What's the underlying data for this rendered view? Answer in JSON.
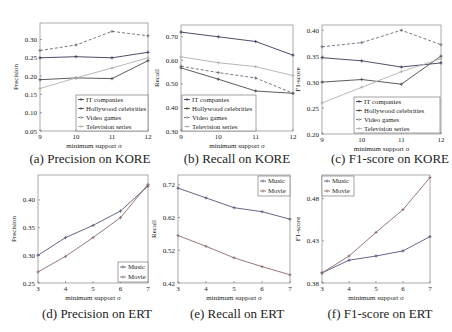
{
  "figure": {
    "captions": [
      "(a) Precision on KORE",
      "(b) Recall on KORE",
      "(c) F1-score on KORE",
      "(d) Precision on ERT",
      "(e) Recall on ERT",
      "(f) F1-score on ERT"
    ]
  },
  "chart_data": [
    {
      "id": "a",
      "type": "line",
      "title": "(a) Precision on KORE",
      "xlabel": "minimum support σ",
      "ylabel": "Precision",
      "x": [
        9,
        10,
        11,
        12
      ],
      "xticks": [
        9,
        10,
        11,
        12
      ],
      "yticks": [
        0.05,
        0.1,
        0.15,
        0.2,
        0.25,
        0.3
      ],
      "ytick_labels": [
        "0.05",
        "0.10",
        "0.15",
        "0.20",
        "0.25",
        "0.30"
      ],
      "ylim": [
        0.05,
        0.345
      ],
      "grid": false,
      "legend_position": "lower right",
      "series": [
        {
          "name": "IT companies",
          "values": [
            0.25,
            0.253,
            0.25,
            0.265
          ],
          "color": "#3a3a5a",
          "dash": ""
        },
        {
          "name": "Hollywood celebrities",
          "values": [
            0.19,
            0.195,
            0.193,
            0.242
          ],
          "color": "#4a4a4a",
          "dash": ""
        },
        {
          "name": "Video games",
          "values": [
            0.27,
            0.285,
            0.322,
            0.31
          ],
          "color": "#6a6a7a",
          "dash": "3,2"
        },
        {
          "name": "Television series",
          "values": [
            0.166,
            0.195,
            0.222,
            0.25
          ],
          "color": "#b0b0b0",
          "dash": ""
        }
      ]
    },
    {
      "id": "b",
      "type": "line",
      "title": "(b) Recall on KORE",
      "xlabel": "minimum support σ",
      "ylabel": "Recall",
      "x": [
        9,
        10,
        11,
        12
      ],
      "xticks": [
        9,
        10,
        11,
        12
      ],
      "yticks": [
        0.3,
        0.4,
        0.5,
        0.6,
        0.7
      ],
      "ytick_labels": [
        "0.30",
        "0.40",
        "0.50",
        "0.60",
        "0.70"
      ],
      "ylim": [
        0.3,
        0.75
      ],
      "grid": false,
      "legend_position": "lower left",
      "series": [
        {
          "name": "IT companies",
          "values": [
            0.72,
            0.7,
            0.68,
            0.622
          ],
          "color": "#3a3a5a",
          "dash": ""
        },
        {
          "name": "Hollywood celebrities",
          "values": [
            0.568,
            0.52,
            0.47,
            0.46
          ],
          "color": "#4a4a4a",
          "dash": ""
        },
        {
          "name": "Video games",
          "values": [
            0.575,
            0.548,
            0.525,
            0.46
          ],
          "color": "#6a6a7a",
          "dash": "3,2"
        },
        {
          "name": "Television series",
          "values": [
            0.615,
            0.59,
            0.573,
            0.535
          ],
          "color": "#b0b0b0",
          "dash": ""
        }
      ]
    },
    {
      "id": "c",
      "type": "line",
      "title": "(c) F1-score on KORE",
      "xlabel": "minimum support σ",
      "ylabel": "F1-score",
      "x": [
        9,
        10,
        11,
        12
      ],
      "xticks": [
        9,
        10,
        11,
        12
      ],
      "yticks": [
        0.2,
        0.25,
        0.3,
        0.35,
        0.4
      ],
      "ytick_labels": [
        "0.20",
        "0.25",
        "0.30",
        "0.35",
        "0.40"
      ],
      "ylim": [
        0.2,
        0.41
      ],
      "grid": false,
      "legend_position": "lower right",
      "series": [
        {
          "name": "IT companies",
          "values": [
            0.347,
            0.341,
            0.329,
            0.337
          ],
          "color": "#3a3a5a",
          "dash": ""
        },
        {
          "name": "Hollywood celebrities",
          "values": [
            0.3,
            0.305,
            0.296,
            0.35
          ],
          "color": "#4a4a4a",
          "dash": ""
        },
        {
          "name": "Video games",
          "values": [
            0.368,
            0.376,
            0.4,
            0.372
          ],
          "color": "#6a6a7a",
          "dash": "3,2"
        },
        {
          "name": "Television series",
          "values": [
            0.26,
            0.29,
            0.32,
            0.345
          ],
          "color": "#b0b0b0",
          "dash": ""
        }
      ]
    },
    {
      "id": "d",
      "type": "line",
      "title": "(d) Precision on ERT",
      "xlabel": "minimum support σ",
      "ylabel": "Precision",
      "x": [
        3,
        4,
        5,
        6,
        7
      ],
      "xticks": [
        3,
        4,
        5,
        6,
        7
      ],
      "yticks": [
        0.25,
        0.3,
        0.35,
        0.4
      ],
      "ytick_labels": [
        "0.25",
        "0.30",
        "0.35",
        "0.40"
      ],
      "ylim": [
        0.25,
        0.445
      ],
      "grid": false,
      "legend_position": "lower right",
      "series": [
        {
          "name": "Music",
          "values": [
            0.3,
            0.332,
            0.354,
            0.38,
            0.425
          ],
          "color": "#55557a",
          "dash": ""
        },
        {
          "name": "Movie",
          "values": [
            0.27,
            0.298,
            0.332,
            0.368,
            0.428
          ],
          "color": "#8a6a6a",
          "dash": ""
        }
      ]
    },
    {
      "id": "e",
      "type": "line",
      "title": "(e) Recall on ERT",
      "xlabel": "minimum support σ",
      "ylabel": "Recall",
      "x": [
        3,
        4,
        5,
        6,
        7
      ],
      "xticks": [
        3,
        4,
        5,
        6,
        7
      ],
      "yticks": [
        0.42,
        0.52,
        0.62,
        0.72
      ],
      "ytick_labels": [
        "0.42",
        "0.52",
        "0.62",
        "0.72"
      ],
      "ylim": [
        0.42,
        0.75
      ],
      "grid": false,
      "legend_position": "upper right",
      "series": [
        {
          "name": "Music",
          "values": [
            0.71,
            0.68,
            0.65,
            0.638,
            0.615
          ],
          "color": "#55557a",
          "dash": ""
        },
        {
          "name": "Movie",
          "values": [
            0.565,
            0.532,
            0.497,
            0.47,
            0.445
          ],
          "color": "#8a6a6a",
          "dash": ""
        }
      ]
    },
    {
      "id": "f",
      "type": "line",
      "title": "(f) F1-score on ERT",
      "xlabel": "minimum support σ",
      "ylabel": "F1-score",
      "x": [
        3,
        4,
        5,
        6,
        7
      ],
      "xticks": [
        3,
        4,
        5,
        6,
        7
      ],
      "yticks": [
        0.38,
        0.43,
        0.48
      ],
      "ytick_labels": [
        "0.38",
        "0.43",
        "0.48"
      ],
      "ylim": [
        0.38,
        0.508
      ],
      "grid": false,
      "legend_position": "upper left",
      "series": [
        {
          "name": "Music",
          "values": [
            0.392,
            0.407,
            0.412,
            0.418,
            0.435
          ],
          "color": "#55557a",
          "dash": ""
        },
        {
          "name": "Movie",
          "values": [
            0.392,
            0.412,
            0.44,
            0.467,
            0.505
          ],
          "color": "#8a6a6a",
          "dash": ""
        }
      ]
    }
  ],
  "layout": {
    "panels": [
      {
        "frame": [
          40,
          23,
          148,
          131
        ],
        "caption_xy": [
          75,
          163
        ],
        "legend": {
          "x": 76,
          "y": 95,
          "w": 72,
          "h": 36
        }
      },
      {
        "frame": [
          181,
          25,
          293,
          131
        ],
        "caption_xy": [
          222,
          163
        ],
        "legend": {
          "x": 182,
          "y": 95,
          "w": 74,
          "h": 36
        }
      },
      {
        "frame": [
          322,
          25,
          441,
          134
        ],
        "caption_xy": [
          375,
          163
        ],
        "legend": {
          "x": 354,
          "y": 97,
          "w": 86,
          "h": 36
        }
      },
      {
        "frame": [
          38,
          175,
          148,
          283
        ],
        "caption_xy": [
          82,
          318
        ],
        "legend": {
          "x": 118,
          "y": 262,
          "w": 30,
          "h": 20
        }
      },
      {
        "frame": [
          178,
          175,
          290,
          283
        ],
        "caption_xy": [
          222,
          318
        ],
        "legend": {
          "x": 258,
          "y": 176,
          "w": 32,
          "h": 20
        }
      },
      {
        "frame": [
          322,
          175,
          430,
          283
        ],
        "caption_xy": [
          365,
          318
        ],
        "legend": {
          "x": 322,
          "y": 176,
          "w": 32,
          "h": 20
        }
      }
    ]
  }
}
